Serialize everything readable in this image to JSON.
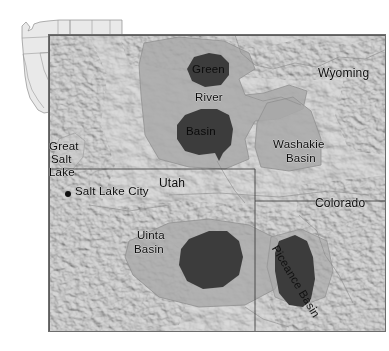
{
  "figure": {
    "kind": "shaded-relief locator map",
    "region": "Green River Formation basins, western USA"
  },
  "inset": {
    "name": "western-united-states-locator",
    "state_label": "Idaho",
    "highlight_box": "study-area-extent"
  },
  "main_map": {
    "states": [
      {
        "id": "wyoming",
        "label": "Wyoming"
      },
      {
        "id": "utah",
        "label": "Utah"
      },
      {
        "id": "colorado",
        "label": "Colorado"
      }
    ],
    "basins": [
      {
        "id": "green-river-basin",
        "label_lines": [
          "Green",
          "River",
          "Basin"
        ]
      },
      {
        "id": "washakie-basin",
        "label_lines": [
          "Washakie",
          "Basin"
        ]
      },
      {
        "id": "uinta-basin",
        "label_lines": [
          "Uinta",
          "Basin"
        ]
      },
      {
        "id": "piceance-basin",
        "label": "Piceance Basin"
      }
    ],
    "water": {
      "id": "great-salt-lake",
      "label_lines": [
        "Great",
        "Salt",
        "Lake"
      ]
    },
    "cities": [
      {
        "id": "salt-lake-city",
        "label": "Salt Lake City"
      }
    ],
    "scale_bar": {
      "ticks": [
        "0",
        "25",
        "50"
      ],
      "unit": "km"
    }
  },
  "colors": {
    "dark_deposit": "#3a3a3a",
    "mid_basin": "#a8a8a8",
    "relief_base": "#d2d2d2",
    "frame": "#6d6d6d",
    "text": "#0d0d0d"
  }
}
